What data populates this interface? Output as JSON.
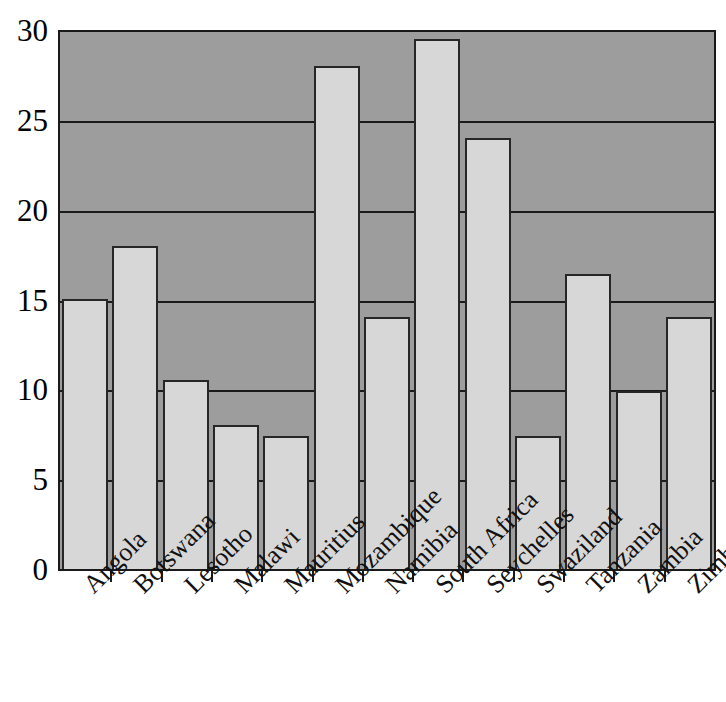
{
  "chart_data": {
    "type": "bar",
    "title": "",
    "subtitle": "",
    "xlabel": "",
    "ylabel": "",
    "ylim": [
      0,
      30
    ],
    "ytick_labels": [
      "0",
      "5",
      "10",
      "15",
      "20",
      "25",
      "30"
    ],
    "ytick_values": [
      0,
      5,
      10,
      15,
      20,
      25,
      30
    ],
    "grid": true,
    "legend": null,
    "categories": [
      "Angola",
      "Botswana",
      "Lesotho",
      "Malawi",
      "Mauritius",
      "Mozambique",
      "Namibia",
      "South Africa",
      "Seychelles",
      "Swaziland",
      "Tanzania",
      "Zambia",
      "Zimbabwe"
    ],
    "values": [
      15.0,
      18.0,
      10.5,
      8.0,
      7.4,
      28.0,
      14.0,
      29.5,
      24.0,
      7.4,
      16.4,
      9.9,
      14.0
    ],
    "colors": {
      "bar_fill": "#d7d7d7",
      "bar_edge": "#262626",
      "plot_background": "#9d9d9d",
      "gridline": "#1a1a1a",
      "axis": "#1a1a1a",
      "text": "#000000",
      "figure_background": "#ffffff"
    }
  }
}
